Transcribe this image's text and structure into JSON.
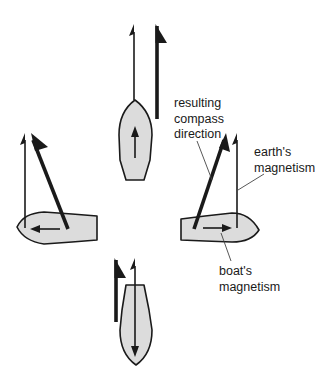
{
  "diagram": {
    "colors": {
      "hull_fill": "#dcdcdc",
      "line": "#1a1a1a",
      "background": "#ffffff"
    },
    "legend_arrows": {
      "thin_arrow": "earth's magnetism",
      "thick_flag_arrow": "resulting compass direction",
      "inner_hull_arrow": "boat's magnetism"
    },
    "boats": [
      {
        "id": "north",
        "heading": "north",
        "boat_magnetism_direction": "forward (up)",
        "compass_deviation": "none"
      },
      {
        "id": "west",
        "heading": "west",
        "boat_magnetism_direction": "left",
        "compass_deviation": "deflected west of north"
      },
      {
        "id": "east",
        "heading": "east",
        "boat_magnetism_direction": "right",
        "compass_deviation": "deflected east of north"
      },
      {
        "id": "south",
        "heading": "south",
        "boat_magnetism_direction": "down",
        "compass_deviation": "none (reduced strength)"
      }
    ],
    "labels": {
      "resulting_compass_direction": [
        "resulting",
        "compass",
        "direction"
      ],
      "earths_magnetism": [
        "earth's",
        "magnetism"
      ],
      "boats_magnetism": [
        "boat's",
        "magnetism"
      ]
    }
  }
}
